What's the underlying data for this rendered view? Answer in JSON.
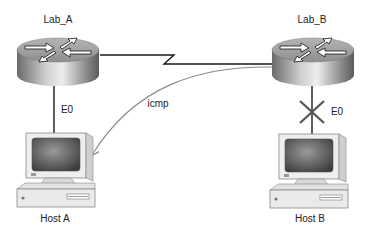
{
  "diagram": {
    "routers": [
      {
        "id": "lab_a",
        "label": "Lab_A",
        "interface_label": "E0"
      },
      {
        "id": "lab_b",
        "label": "Lab_B",
        "interface_label": "E0"
      }
    ],
    "hosts": [
      {
        "id": "host_a",
        "label": "Host A"
      },
      {
        "id": "host_b",
        "label": "Host B"
      }
    ],
    "links": [
      {
        "from": "Lab_A",
        "to": "Lab_B",
        "type": "serial"
      },
      {
        "from": "Lab_A",
        "to": "Host A",
        "type": "ethernet",
        "interface": "E0"
      },
      {
        "from": "Lab_B",
        "to": "Host B",
        "type": "ethernet",
        "interface": "E0",
        "status": "down"
      }
    ],
    "message": {
      "label": "icmp",
      "from": "Lab_B",
      "to": "Host A"
    },
    "colors": {
      "line": "#1a1a1a",
      "icmp_arrow": "#8a8a8a",
      "failure_mark": "#555555"
    }
  }
}
